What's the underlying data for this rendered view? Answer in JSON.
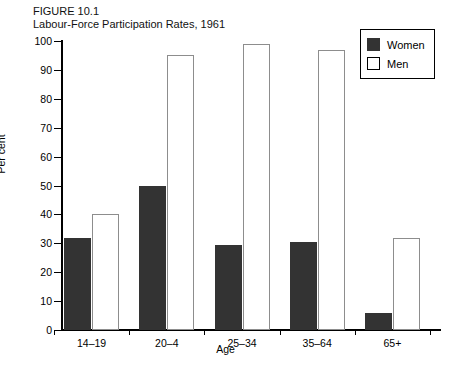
{
  "figure": {
    "number_line": "FIGURE 10.1",
    "title_line": "Labour-Force Participation Rates, 1961"
  },
  "legend": {
    "position": "top-right",
    "entries": [
      {
        "label": "Women",
        "color": "#333333",
        "swatch": "filled"
      },
      {
        "label": "Men",
        "color": "#ffffff",
        "swatch": "outline"
      }
    ]
  },
  "axes": {
    "y_title": "Per cent",
    "x_title": "Age",
    "y_ticks": [
      0,
      10,
      20,
      30,
      40,
      50,
      60,
      70,
      80,
      90,
      100
    ]
  },
  "chart_data": {
    "type": "bar",
    "title": "Labour-Force Participation Rates, 1961",
    "subtitle": "FIGURE 10.1",
    "categories": [
      "14–19",
      "20–4",
      "25–34",
      "35–64",
      "65+"
    ],
    "series": [
      {
        "name": "Women",
        "color": "#333333",
        "values": [
          32,
          50,
          29.5,
          30.5,
          6
        ]
      },
      {
        "name": "Men",
        "color": "#ffffff",
        "values": [
          40,
          95,
          99,
          97,
          32
        ]
      }
    ],
    "xlabel": "Age",
    "ylabel": "Per cent",
    "ylim": [
      0,
      100
    ],
    "ytick_step": 10,
    "grid": false,
    "legend_position": "top-right"
  }
}
